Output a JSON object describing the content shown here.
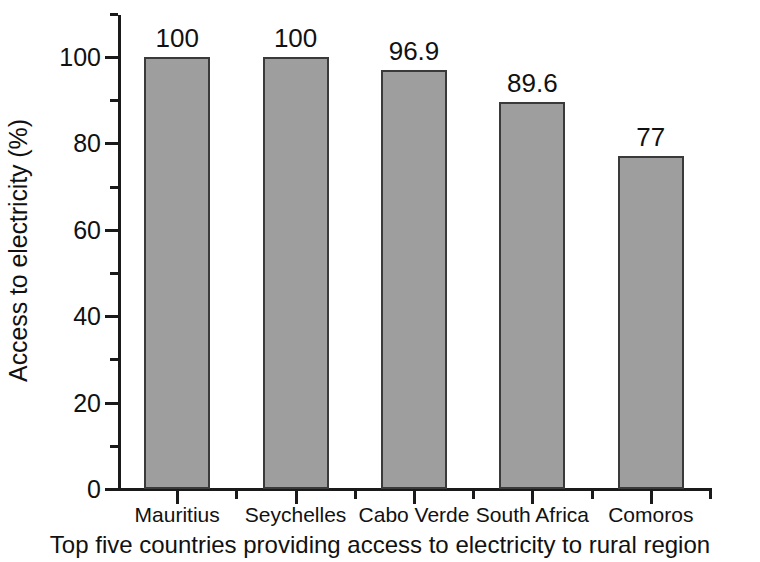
{
  "chart_data": {
    "type": "bar",
    "title": "",
    "caption": "Top five countries providing access to electricity to rural region",
    "xlabel": "",
    "ylabel": "Access to electricity (%)",
    "categories": [
      "Mauritius",
      "Seychelles",
      "Cabo Verde",
      "South Africa",
      "Comoros"
    ],
    "values": [
      100,
      100,
      96.9,
      89.6,
      77
    ],
    "value_labels": [
      "100",
      "100",
      "96.9",
      "89.6",
      "77"
    ],
    "ylim": [
      0,
      110
    ],
    "ytick_values": [
      0,
      20,
      40,
      60,
      80,
      100
    ],
    "ytick_labels": [
      "0",
      "20",
      "40",
      "60",
      "80",
      "100"
    ],
    "yminor_values": [
      10,
      30,
      50,
      70,
      90,
      110
    ],
    "grid": false,
    "legend": false,
    "series": [
      {
        "name": "Access to electricity (%)",
        "values": [
          100,
          100,
          96.9,
          89.6,
          77
        ]
      }
    ],
    "colors": {
      "bar_fill": "#9e9e9e",
      "bar_edge": "#3a3a3a",
      "axis": "#1a1a1a",
      "text": "#111111",
      "background": "#ffffff"
    }
  }
}
